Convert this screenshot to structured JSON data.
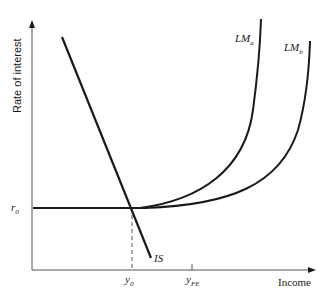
{
  "diagram": {
    "type": "IS-LM",
    "axes": {
      "y_label": "Rate of interest",
      "x_label": "Income"
    },
    "labels": {
      "r0": "r",
      "r0_sub": "0",
      "y0": "y",
      "y0_sub": "0",
      "yfe": "y",
      "yfe_sub": "FE",
      "is": "IS",
      "lma": "LM",
      "lma_sub": "a",
      "lmb": "LM",
      "lmb_sub": "b"
    },
    "colors": {
      "line": "#1a1a1a",
      "axis": "#555555",
      "background": "#ffffff"
    }
  }
}
